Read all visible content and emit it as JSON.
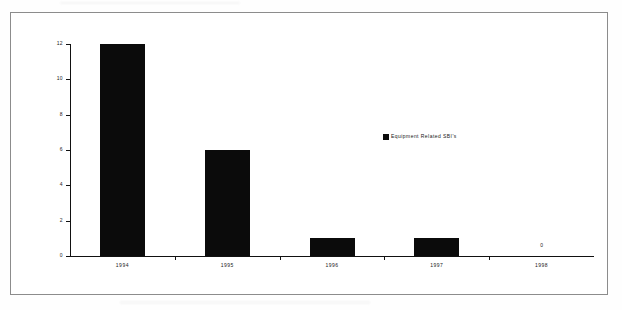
{
  "chart_data": {
    "type": "bar",
    "title": "",
    "xlabel": "",
    "ylabel": "",
    "categories": [
      "1994",
      "1995",
      "1996",
      "1997",
      "1998"
    ],
    "values": [
      12,
      6,
      1,
      1,
      0
    ],
    "point_labels": [
      "",
      "",
      "",
      "",
      "0"
    ],
    "series": [
      {
        "name": "Equipment Related SBI's",
        "values": [
          12,
          6,
          1,
          1,
          0
        ],
        "color": "#0b0b0b"
      }
    ],
    "ylim": [
      0,
      12
    ],
    "yticks": [
      "0",
      "2",
      "4",
      "6",
      "8",
      "10",
      "12"
    ],
    "ytick_values": [
      0,
      2,
      4,
      6,
      8,
      10,
      12
    ],
    "grid": false,
    "legend": {
      "position": "center-right",
      "entries": [
        {
          "label": "Equipment Related SBI's",
          "color": "#0b0b0b",
          "marker": "square"
        }
      ]
    }
  },
  "legend": {
    "label": "Equipment Related SBI's"
  },
  "colors": {
    "bar": "#0b0b0b",
    "axis": "#111111",
    "frame": "#8c8c8c",
    "background": "#ffffff",
    "text": "#1a1a1a"
  }
}
